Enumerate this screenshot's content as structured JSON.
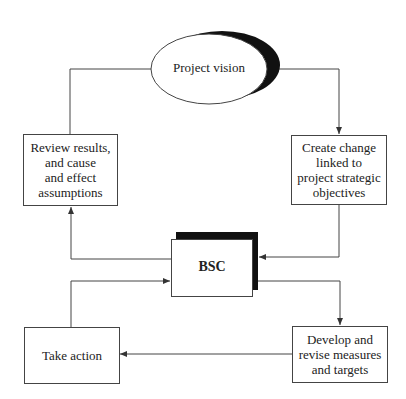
{
  "diagram": {
    "nodes": {
      "vision": {
        "label": "Project vision",
        "shape": "ellipse"
      },
      "review": {
        "label": "Review results, and cause and effect assumptions",
        "lines": [
          "Review results,",
          "and cause",
          "and effect",
          "assumptions"
        ]
      },
      "create": {
        "label": "Create change linked to project strategic objectives",
        "lines": [
          "Create change",
          "linked to",
          "project strategic",
          "objectives"
        ]
      },
      "bsc": {
        "label": "BSC"
      },
      "take_action": {
        "label": "Take action"
      },
      "develop": {
        "label": "Develop and revise measures and targets",
        "lines": [
          "Develop and",
          "revise measures",
          "and targets"
        ]
      }
    },
    "edges": [
      {
        "from": "vision",
        "to": "create",
        "arrow": true
      },
      {
        "from": "create",
        "to": "bsc",
        "arrow": true
      },
      {
        "from": "bsc",
        "to": "review",
        "arrow": true
      },
      {
        "from": "review",
        "to": "vision",
        "arrow": false
      },
      {
        "from": "bsc",
        "to": "develop",
        "arrow": true
      },
      {
        "from": "develop",
        "to": "take_action",
        "arrow": true
      },
      {
        "from": "take_action",
        "to": "bsc",
        "arrow": true
      }
    ],
    "colors": {
      "line": "#444444",
      "shadow": "#111111",
      "background": "#ffffff"
    }
  }
}
